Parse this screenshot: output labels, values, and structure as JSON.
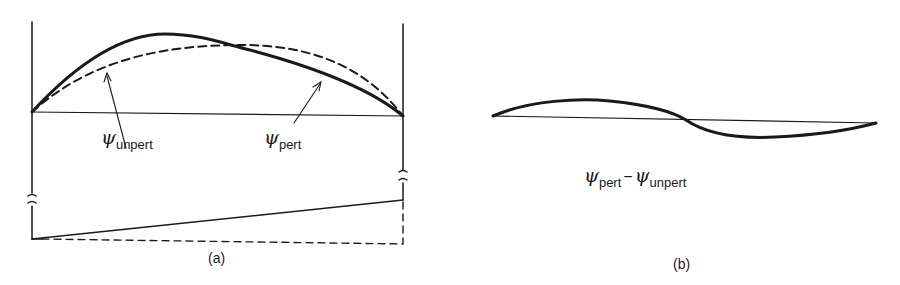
{
  "panel_a": {
    "caption": "(a)",
    "labels": {
      "unpert": {
        "symbol": "ψ",
        "subscript": "unpert"
      },
      "pert": {
        "symbol": "ψ",
        "subscript": "pert"
      }
    },
    "curves": [
      {
        "name": "psi-unpert",
        "style": "dashed",
        "description": "symmetric ground-state wavefunction"
      },
      {
        "name": "psi-pert",
        "style": "solid-thick",
        "description": "perturbed wavefunction shifted left"
      },
      {
        "name": "potential-perturbed",
        "style": "solid",
        "description": "linear tilted potential"
      },
      {
        "name": "potential-unperturbed",
        "style": "dashed",
        "description": "flat well bottom"
      }
    ]
  },
  "panel_b": {
    "caption": "(b)",
    "label": {
      "a_symbol": "ψ",
      "a_subscript": "pert",
      "op": "−",
      "b_symbol": "ψ",
      "b_subscript": "unpert"
    },
    "curves": [
      {
        "name": "difference",
        "style": "solid-thick",
        "description": "antisymmetric difference"
      }
    ]
  },
  "colors": {
    "ink": "#1a1a1a",
    "background": "#ffffff"
  }
}
